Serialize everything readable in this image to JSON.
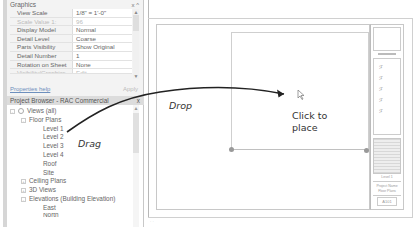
{
  "properties": {
    "section_title": "Graphics",
    "header_controls": "x ^",
    "rows": [
      {
        "key": "View Scale",
        "value": "1/8\" = 1'-0\"",
        "dim": false
      },
      {
        "key": "Scale Value    1:",
        "value": "96",
        "dim": true
      },
      {
        "key": "Display Model",
        "value": "Normal",
        "dim": false
      },
      {
        "key": "Detail Level",
        "value": "Coarse",
        "dim": false
      },
      {
        "key": "Parts Visibility",
        "value": "Show Original",
        "dim": false
      },
      {
        "key": "Detail Number",
        "value": "1",
        "dim": false
      },
      {
        "key": "Rotation on Sheet",
        "value": "None",
        "dim": false
      },
      {
        "key": "Visibility/Graphics ...",
        "value": "Edit...",
        "dim": true
      }
    ],
    "help_link": "Properties help",
    "apply_button": "Apply"
  },
  "project_browser": {
    "title": "Project Browser - RAC Commercial",
    "close": "x",
    "tree": [
      {
        "label": "Views (all)",
        "indent": 0,
        "toggle": "-",
        "icon": "views"
      },
      {
        "label": "Floor Plans",
        "indent": 1,
        "toggle": "-"
      },
      {
        "label": "Level 1",
        "indent": 2
      },
      {
        "label": "Level 2",
        "indent": 2
      },
      {
        "label": "Level 3",
        "indent": 2
      },
      {
        "label": "Level 4",
        "indent": 2
      },
      {
        "label": "Roof",
        "indent": 2
      },
      {
        "label": "Site",
        "indent": 2
      },
      {
        "label": "Ceiling Plans",
        "indent": 1,
        "toggle": "+"
      },
      {
        "label": "3D Views",
        "indent": 1,
        "toggle": "+"
      },
      {
        "label": "Elevations (Building Elevation)",
        "indent": 1,
        "toggle": "-"
      },
      {
        "label": "East",
        "indent": 2
      },
      {
        "label": "North",
        "indent": 2
      }
    ]
  },
  "annotations": {
    "drag": "Drag",
    "drop": "Drop",
    "click_to_place_1": "Click to",
    "click_to_place_2": "place"
  },
  "title_block": {
    "glyph": "ℱ",
    "label_1": "Level 1",
    "label_2": "Project Name",
    "label_3": "Floor Plans",
    "sheet_number": "A101"
  },
  "colors": {
    "link": "#6d8fbd",
    "annotation": "#333333",
    "panel_bg": "#f3f3f3"
  }
}
